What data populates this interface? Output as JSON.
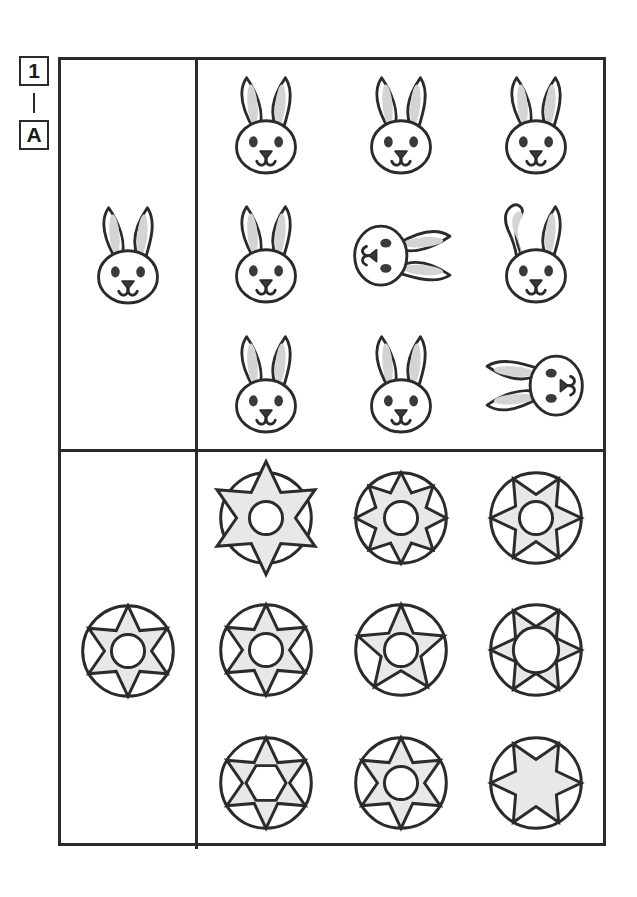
{
  "sheet": {
    "labels": {
      "number": "1",
      "letter": "A",
      "separator": "dash"
    }
  },
  "colors": {
    "outline": "#2b2b2b",
    "fill_gray": "#d4d4d4",
    "fill_light_gray": "#e8e8e8",
    "fill_white": "#ffffff",
    "eye_dark": "#3a3a3a",
    "page_background": "#ffffff"
  },
  "panels": [
    {
      "id": "panel-bunny",
      "name": "bunny-face-panel",
      "reference": {
        "name": "reference-bunny",
        "shape": "bunny-head",
        "description": "upright bunny head, two straight gray ears, two eyes, triangular nose, smile"
      },
      "options": [
        {
          "name": "bunny-option-1",
          "shape": "bunny-head",
          "variant": "upright-standard",
          "rotation": 0,
          "description": "upright bunny head matching reference"
        },
        {
          "name": "bunny-option-2",
          "shape": "bunny-head",
          "variant": "upright-standard",
          "rotation": 0,
          "description": "upright bunny head matching reference"
        },
        {
          "name": "bunny-option-3",
          "shape": "bunny-head",
          "variant": "upright-standard",
          "rotation": 0,
          "description": "upright bunny head matching reference"
        },
        {
          "name": "bunny-option-4",
          "shape": "bunny-head",
          "variant": "upright-standard",
          "rotation": 0,
          "description": "upright bunny head matching reference"
        },
        {
          "name": "bunny-option-5",
          "shape": "bunny-head",
          "variant": "rotated-right",
          "rotation": 90,
          "description": "bunny head rotated ninety degrees, ears pointing left"
        },
        {
          "name": "bunny-option-6",
          "shape": "bunny-head",
          "variant": "bent-ear",
          "rotation": 0,
          "description": "upright bunny head with left ear folded over"
        },
        {
          "name": "bunny-option-7",
          "shape": "bunny-head",
          "variant": "upright-standard",
          "rotation": 0,
          "description": "upright bunny head matching reference"
        },
        {
          "name": "bunny-option-8",
          "shape": "bunny-head",
          "variant": "upright-standard",
          "rotation": 0,
          "description": "upright bunny head matching reference"
        },
        {
          "name": "bunny-option-9",
          "shape": "bunny-head",
          "variant": "rotated-left",
          "rotation": -90,
          "description": "bunny head rotated minus ninety degrees, ears pointing right"
        }
      ]
    },
    {
      "id": "panel-star",
      "name": "star-medallion-panel",
      "reference": {
        "name": "reference-medallion",
        "shape": "star-in-circle",
        "points": 6,
        "center": "circle",
        "star_scale": "inside",
        "description": "six pointed gray star inside an outlined circle with a white circular center"
      },
      "options": [
        {
          "name": "medallion-option-1",
          "shape": "star-in-circle",
          "points": 6,
          "center": "circle",
          "star_scale": "oversized",
          "rotation": 0,
          "description": "six pointed star larger than the circle, points break past the rim"
        },
        {
          "name": "medallion-option-2",
          "shape": "star-in-circle",
          "points": 8,
          "center": "circle",
          "star_scale": "inside",
          "rotation": 0,
          "description": "eight pointed star inside the circle"
        },
        {
          "name": "medallion-option-3",
          "shape": "star-in-circle",
          "points": 6,
          "center": "circle",
          "star_scale": "inside",
          "rotation": 30,
          "description": "six pointed star rotated thirty degrees inside the circle"
        },
        {
          "name": "medallion-option-4",
          "shape": "star-in-circle",
          "points": 6,
          "center": "circle",
          "star_scale": "inside",
          "rotation": 0,
          "description": "six pointed star inside the circle matching reference"
        },
        {
          "name": "medallion-option-5",
          "shape": "star-in-circle",
          "points": 5,
          "center": "circle",
          "star_scale": "inside",
          "rotation": 0,
          "description": "five pointed star inside the circle"
        },
        {
          "name": "medallion-option-6",
          "shape": "star-in-circle",
          "points": 6,
          "center": "circle-large",
          "star_scale": "inside",
          "rotation": 30,
          "description": "six pointed star with an oversized center circle"
        },
        {
          "name": "medallion-option-7",
          "shape": "star-in-circle",
          "points": 6,
          "center": "hexagon",
          "star_scale": "inside",
          "rotation": 0,
          "description": "six pointed star with a hexagonal center"
        },
        {
          "name": "medallion-option-8",
          "shape": "star-in-circle",
          "points": 6,
          "center": "circle",
          "star_scale": "inside",
          "rotation": 0,
          "description": "six pointed star inside the circle matching reference"
        },
        {
          "name": "medallion-option-9",
          "shape": "star-in-circle",
          "points": 6,
          "center": "none",
          "star_scale": "inside",
          "rotation": 30,
          "description": "six pointed solid star with no center cutout"
        }
      ]
    }
  ]
}
